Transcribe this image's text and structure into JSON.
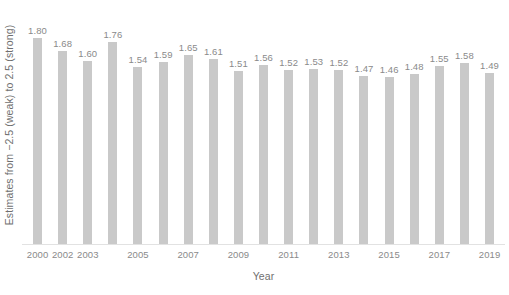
{
  "chart_data": {
    "type": "bar",
    "title": "",
    "xlabel": "Year",
    "ylabel": "Estimates from −2.5 (weak) to 2.5 (strong)",
    "ylim": [
      0,
      1.98
    ],
    "grid": false,
    "legend": null,
    "categories": [
      "2000",
      "2002",
      "2003",
      "2004",
      "2005",
      "2006",
      "2007",
      "2008",
      "2009",
      "2010",
      "2011",
      "2012",
      "2013",
      "2014",
      "2015",
      "2016",
      "2017",
      "2018",
      "2019"
    ],
    "tick_labels": [
      "2000",
      "2002",
      "2003",
      "",
      "2005",
      "",
      "2007",
      "",
      "2009",
      "",
      "2011",
      "",
      "2013",
      "",
      "2015",
      "",
      "2017",
      "",
      "2019"
    ],
    "values": [
      1.8,
      1.68,
      1.6,
      1.76,
      1.54,
      1.59,
      1.65,
      1.61,
      1.51,
      1.56,
      1.52,
      1.53,
      1.52,
      1.47,
      1.46,
      1.48,
      1.55,
      1.58,
      1.49
    ],
    "value_labels": [
      "1.80",
      "1.68",
      "1.60",
      "1.76",
      "1.54",
      "1.59",
      "1.65",
      "1.61",
      "1.51",
      "1.56",
      "1.52",
      "1.53",
      "1.52",
      "1.47",
      "1.46",
      "1.48",
      "1.55",
      "1.58",
      "1.49"
    ],
    "bar_color": "#c9c9c9",
    "label_color": "#8a8a8a",
    "axis_title_color": "#6f6f6f",
    "background_color": "#ffffff"
  }
}
